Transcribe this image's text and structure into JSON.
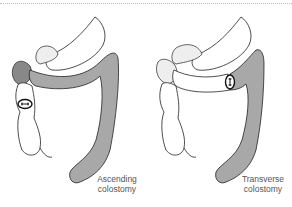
{
  "figure": {
    "panels": [
      {
        "id": "ascending",
        "caption_line1": "Ascending",
        "caption_line2": "colostomy",
        "stoma_location": "ascending colon"
      },
      {
        "id": "transverse",
        "caption_line1": "Transverse",
        "caption_line2": "colostomy",
        "stoma_location": "transverse colon"
      }
    ],
    "colors": {
      "shaded_bowel": "#a8a8a8",
      "outline": "#222222",
      "unshaded_bowel": "#ffffff",
      "caption_text": "#555555"
    }
  }
}
